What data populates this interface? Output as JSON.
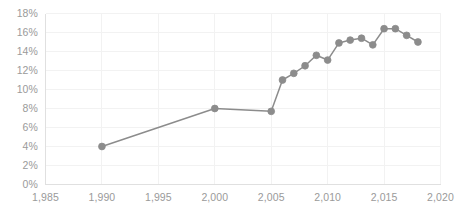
{
  "chart_data": {
    "type": "line",
    "title": "",
    "subtitle": "",
    "xlabel": "",
    "ylabel": "",
    "xlim": [
      1985,
      2020
    ],
    "ylim": [
      0,
      0.18
    ],
    "grid": true,
    "legend": false,
    "legend_position": "none",
    "marker": "circle",
    "series_color": "#8c8c8c",
    "x": [
      1990,
      2000,
      2005,
      2006,
      2007,
      2008,
      2009,
      2010,
      2011,
      2012,
      2013,
      2014,
      2015,
      2016,
      2017,
      2018
    ],
    "values": [
      4.0,
      8.0,
      7.7,
      11.0,
      11.7,
      12.5,
      13.6,
      13.1,
      14.9,
      15.2,
      15.4,
      14.7,
      16.4,
      16.4,
      15.7,
      15.0
    ],
    "y_tick_labels": [
      "18%",
      "16%",
      "14%",
      "12%",
      "10%",
      "8%",
      "6%",
      "4%",
      "2%",
      "0%"
    ],
    "y_tick_values": [
      18,
      16,
      14,
      12,
      10,
      8,
      6,
      4,
      2,
      0
    ],
    "x_tick_labels": [
      "1,985",
      "1,990",
      "1,995",
      "2,000",
      "2,005",
      "2,010",
      "2,015",
      "2,020"
    ],
    "x_tick_values": [
      1985,
      1990,
      1995,
      2000,
      2005,
      2010,
      2015,
      2020
    ],
    "axis_text_color": "#9a9a9a",
    "gridline_color": "#f2f2f2",
    "axis_line_color": "#e0e0e0",
    "background_color": "#ffffff"
  }
}
